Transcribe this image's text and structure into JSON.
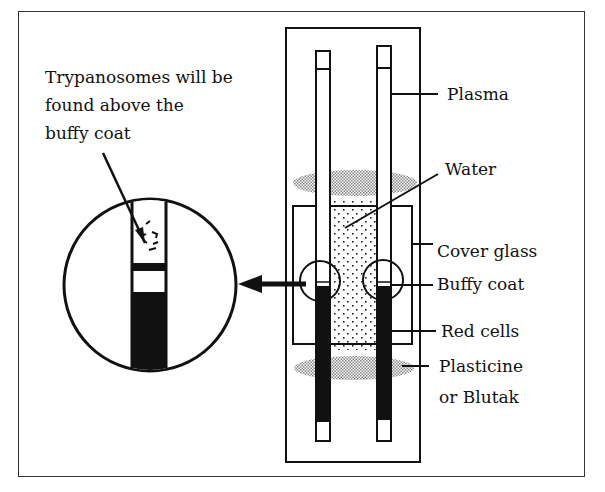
{
  "diagram": {
    "caption": {
      "line1": "Trypanosomes will be",
      "line2": "found above the",
      "line3": "buffy coat"
    },
    "labels": {
      "plasma": "Plasma",
      "water": "Water",
      "cover_glass": "Cover glass",
      "buffy_coat": "Buffy coat",
      "red_cells": "Red cells",
      "plasticine_line1": "Plasticine",
      "plasticine_line2": "or Blutak"
    },
    "colors": {
      "ink": "#111111",
      "background": "#ffffff",
      "stipple": "#9a9a9a"
    }
  }
}
